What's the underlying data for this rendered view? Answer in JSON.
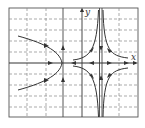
{
  "diagram": {
    "type": "phase-portrait",
    "axes": {
      "x_label": "x",
      "y_label": "y"
    },
    "colors": {
      "curve": "#333333",
      "grid": "#777777",
      "background": "#ffffff"
    },
    "frame": {
      "left": 9,
      "top": 8,
      "right": 138,
      "bottom": 117
    },
    "grid": {
      "vertical_dashed_x": [
        27,
        46,
        119
      ],
      "vertical_solid_x": [
        63,
        82
      ],
      "asymptote_x": [
        99.5,
        102
      ],
      "horizontal_dashed_y": [
        19,
        30,
        41,
        52,
        74,
        85,
        96,
        107
      ],
      "x_axis_y": 63
    },
    "trajectories": [
      {
        "name": "left-parabola",
        "description": "curve opening left, vertex at x≈63 on x-axis, flow toward vertex"
      },
      {
        "name": "upper-left-hyperbola-branch",
        "description": "approaches asymptote from left, upper half"
      },
      {
        "name": "upper-right-hyperbola-branch",
        "description": "approaches asymptote from right, upper half"
      },
      {
        "name": "lower-left-hyperbola-branch",
        "description": "approaches asymptote from left, lower half"
      },
      {
        "name": "lower-right-hyperbola-branch",
        "description": "approaches asymptote from right, lower half"
      }
    ],
    "x_axis_arrows": [
      {
        "x": 50,
        "dir": "right"
      },
      {
        "x": 73,
        "dir": "left"
      },
      {
        "x": 92,
        "dir": "left"
      },
      {
        "x": 109,
        "dir": "right"
      },
      {
        "x": 126,
        "dir": "right"
      }
    ]
  }
}
